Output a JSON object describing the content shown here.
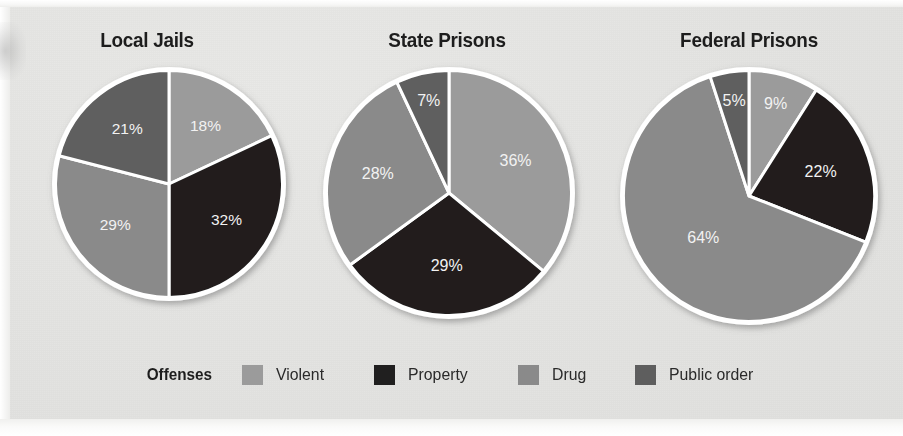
{
  "figure": {
    "background_color": "#e4e4e2",
    "page_color": "#ffffff"
  },
  "legend": {
    "title": "Offenses",
    "items": [
      {
        "label": "Violent",
        "color": "#9b9b9b",
        "swatch_name": "legend-swatch-violent"
      },
      {
        "label": "Property",
        "color": "#201f1f",
        "swatch_name": "legend-swatch-property"
      },
      {
        "label": "Drug",
        "color": "#8a8a8a",
        "swatch_name": "legend-swatch-drug"
      },
      {
        "label": "Public order",
        "color": "#5e5e5e",
        "swatch_name": "legend-swatch-public-order"
      }
    ]
  },
  "chart_data": {
    "type": "pie",
    "title": "",
    "legend_position": "bottom",
    "legend_title": "Offenses",
    "value_suffix": "%",
    "categories": [
      "Violent",
      "Property",
      "Drug",
      "Public order"
    ],
    "colors": [
      "#9b9b9b",
      "#201f1f",
      "#8a8a8a",
      "#5e5e5e"
    ],
    "slice_label_color": "#f2f2f2",
    "slice_stroke_color": "#ffffff",
    "start_angle_deg": 0,
    "direction": "clockwise",
    "charts": [
      {
        "title": "Local Jails",
        "labels": [
          "18%",
          "32%",
          "29%",
          "21%"
        ],
        "values": [
          18,
          32,
          29,
          21
        ]
      },
      {
        "title": "State Prisons",
        "labels": [
          "36%",
          "29%",
          "28%",
          "7%"
        ],
        "values": [
          36,
          29,
          28,
          7
        ]
      },
      {
        "title": "Federal Prisons",
        "labels": [
          "9%",
          "22%",
          "64%",
          "5%"
        ],
        "values": [
          9,
          22,
          64,
          5
        ]
      }
    ]
  }
}
